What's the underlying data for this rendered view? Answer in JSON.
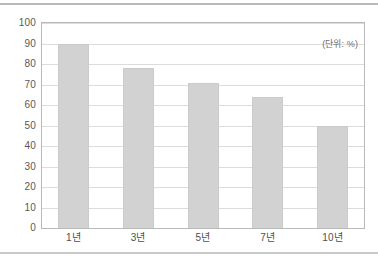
{
  "figure": {
    "unit_note": "(단위: %)"
  },
  "chart_data": {
    "type": "bar",
    "title": "",
    "subtitle": "",
    "xlabel": "",
    "ylabel": "",
    "annotations": [
      "(단위: %)"
    ],
    "categories": [
      "1년",
      "3년",
      "5년",
      "7년",
      "10년"
    ],
    "values": [
      90,
      78,
      70.5,
      64,
      50
    ],
    "ylim": [
      0,
      100
    ],
    "ytick_step": 10,
    "yticks": [
      100,
      90,
      80,
      70,
      60,
      50,
      40,
      30,
      20,
      10,
      0
    ],
    "ytick_labels": [
      "100",
      "90",
      "80",
      "70",
      "60",
      "50",
      "40",
      "30",
      "20",
      "10",
      "0"
    ],
    "grid": "horizontal",
    "legend": "none",
    "bar_color": "#d2d2d2",
    "gridline_color": "#dcdcdc",
    "axis_color": "#b9b9b9",
    "tick_label_color": "#58585a"
  }
}
